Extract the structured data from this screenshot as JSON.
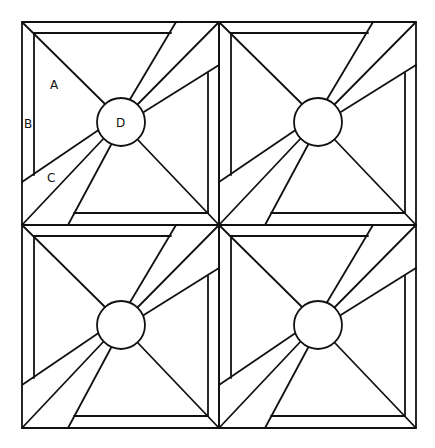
{
  "diagram": {
    "stroke_color": "#111111",
    "background": "#ffffff",
    "grid": {
      "rows": 2,
      "cols": 2
    },
    "labels": {
      "A": "A",
      "B": "B",
      "C": "C",
      "D": "D"
    },
    "blocks": [
      {
        "id": "block-top-left",
        "labeled": true
      },
      {
        "id": "block-top-right",
        "labeled": false
      },
      {
        "id": "block-bottom-left",
        "labeled": false
      },
      {
        "id": "block-bottom-right",
        "labeled": false
      }
    ]
  }
}
